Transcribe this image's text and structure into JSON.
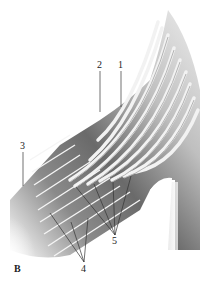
{
  "figure": {
    "panel_letter": "B",
    "labels": [
      {
        "id": "1",
        "text": "1",
        "x": 118,
        "y": 60
      },
      {
        "id": "2",
        "text": "2",
        "x": 97,
        "y": 60
      },
      {
        "id": "3",
        "text": "3",
        "x": 20,
        "y": 141
      },
      {
        "id": "4",
        "text": "4",
        "x": 81,
        "y": 264
      },
      {
        "id": "5",
        "text": "5",
        "x": 112,
        "y": 236
      }
    ],
    "colors": {
      "background": "#ffffff",
      "fiber_light": "#e4e4e4",
      "fiber_mid": "#bdbdbd",
      "sheath_dark": "#6e6e6e",
      "leader_line": "#333333",
      "label_text": "#222222"
    }
  }
}
